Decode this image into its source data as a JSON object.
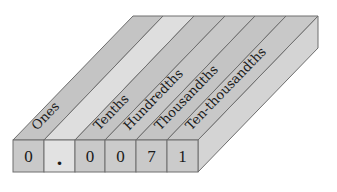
{
  "diagram": {
    "type": "place-value-chart-3d",
    "number": "0.0071",
    "columns": [
      {
        "label": "Ones",
        "digit": "0"
      },
      {
        "label": "",
        "digit": "."
      },
      {
        "label": "Tenths",
        "digit": "0"
      },
      {
        "label": "Hundredths",
        "digit": "0"
      },
      {
        "label": "Thousandths",
        "digit": "7"
      },
      {
        "label": "Ten-thousandths",
        "digit": "1"
      }
    ],
    "colors": {
      "stripe": "#c4c4c4",
      "stripe_decimal": "#dedede",
      "cell": "#c9c9c9",
      "cell_decimal": "#e2e2e2",
      "side": "#d4d4d4",
      "border": "#6e6e6e",
      "text": "#1a1a1a"
    }
  }
}
